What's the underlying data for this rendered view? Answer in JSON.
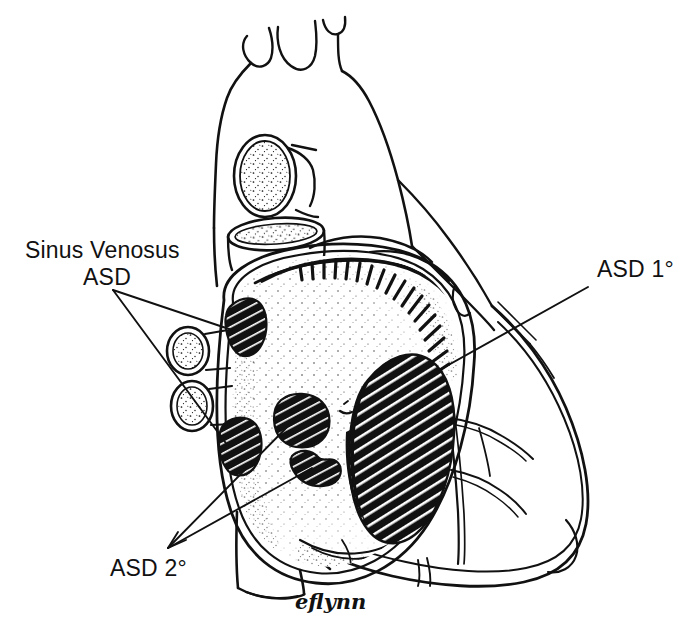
{
  "figure": {
    "background_color": "#ffffff",
    "ink_color": "#111111",
    "width": 681,
    "height": 635
  },
  "labels": [
    {
      "id": "sinus-venosus-asd",
      "line1": "Sinus Venosus",
      "line2": "ASD",
      "x": 25,
      "y": 258,
      "x2": 95,
      "y2": 285
    },
    {
      "id": "asd-primum",
      "text": "ASD 1°",
      "x": 597,
      "y": 277
    },
    {
      "id": "asd-secundum",
      "text": "ASD 2°",
      "x": 110,
      "y": 576
    }
  ],
  "signature": {
    "text": "eflynn",
    "x": 295,
    "y": 609
  },
  "anatomy": {
    "structures": [
      "aortic arch",
      "brachiocephalic trunk",
      "left common carotid artery",
      "left subclavian artery",
      "superior vena cava stump",
      "right pulmonary artery stump",
      "right pulmonary veins",
      "opened right atrium",
      "atrial septum",
      "right ventricle",
      "coronary arteries",
      "cardiac apex"
    ],
    "defects": [
      {
        "name": "sinus venosus defect superior",
        "type": "Sinus Venosus ASD",
        "cx": 243,
        "cy": 324
      },
      {
        "name": "sinus venosus defect inferior",
        "type": "Sinus Venosus ASD",
        "cx": 238,
        "cy": 443
      },
      {
        "name": "ostium secundum defect central",
        "type": "ASD 2°",
        "cx": 301,
        "cy": 418
      },
      {
        "name": "ostium secundum defect lower",
        "type": "ASD 2°",
        "cx": 313,
        "cy": 465
      },
      {
        "name": "ostium primum defect",
        "type": "ASD 1°",
        "cx": 400,
        "cy": 455
      }
    ]
  }
}
